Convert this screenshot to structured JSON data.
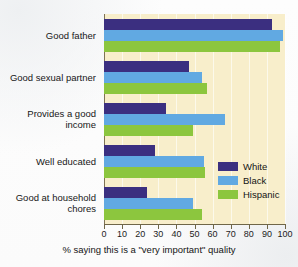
{
  "chart_data": {
    "type": "bar",
    "orientation": "horizontal",
    "title": "",
    "xlabel": "% saying this is a \"very important\" quality",
    "ylabel": "",
    "xlim": [
      0,
      100
    ],
    "xticks": [
      0,
      10,
      20,
      30,
      40,
      50,
      60,
      70,
      80,
      90,
      100
    ],
    "grid": "vertical",
    "legend_position": "inside-right",
    "categories": [
      "Good father",
      "Good sexual partner",
      "Provides a good income",
      "Well educated",
      "Good at household chores"
    ],
    "series": [
      {
        "name": "White",
        "color": "#3b2f80",
        "values": [
          93,
          47,
          34,
          28,
          24
        ]
      },
      {
        "name": "Black",
        "color": "#61a9e2",
        "values": [
          99,
          54,
          67,
          55,
          49
        ]
      },
      {
        "name": "Hispanic",
        "color": "#8cc63e",
        "values": [
          97,
          57,
          49,
          56,
          54
        ]
      }
    ]
  },
  "category_lines": [
    [
      "Good father"
    ],
    [
      "Good sexual partner"
    ],
    [
      "Provides a good",
      "income"
    ],
    [
      "Well educated"
    ],
    [
      "Good at household",
      "chores"
    ]
  ],
  "legend": [
    {
      "label": "White",
      "color": "#3b2f80"
    },
    {
      "label": "Black",
      "color": "#61a9e2"
    },
    {
      "label": "Hispanic",
      "color": "#8cc63e"
    }
  ],
  "xtick_labels": [
    "0",
    "10",
    "20",
    "30",
    "40",
    "50",
    "60",
    "70",
    "80",
    "90",
    "100"
  ],
  "xaxis_title": "% saying this is a \"very important\" quality",
  "colors": {
    "plot_background": "#f8eecb",
    "axis": "#6f6648",
    "page_background": "#fdfdfd"
  }
}
